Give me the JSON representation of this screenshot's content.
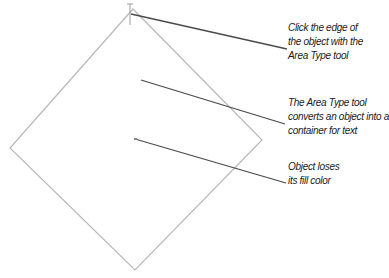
{
  "diagram": {
    "shape": {
      "type": "diamond",
      "stroke": "#b8b8b8",
      "points": "133,9 262,140 135,270 10,148"
    },
    "cursor": {
      "type": "area-type-cursor",
      "x": 130,
      "y1": 5,
      "y2": 25
    },
    "callouts": [
      {
        "lines": [
          "Click the edge of",
          "the object with the",
          "Area Type tool"
        ],
        "leader": {
          "x1": 131,
          "y1": 14,
          "x2": 287,
          "y2": 49
        },
        "top": 21
      },
      {
        "lines": [
          "The Area Type tool",
          "converts an object into a",
          "container for text"
        ],
        "leader": {
          "x1": 141,
          "y1": 80,
          "x2": 285,
          "y2": 124
        },
        "top": 96
      },
      {
        "lines": [
          "Object loses",
          "its fill color"
        ],
        "leader": {
          "x1": 135,
          "y1": 139,
          "x2": 286,
          "y2": 183
        },
        "top": 160
      }
    ],
    "leader_color": "#4a4a4a"
  }
}
